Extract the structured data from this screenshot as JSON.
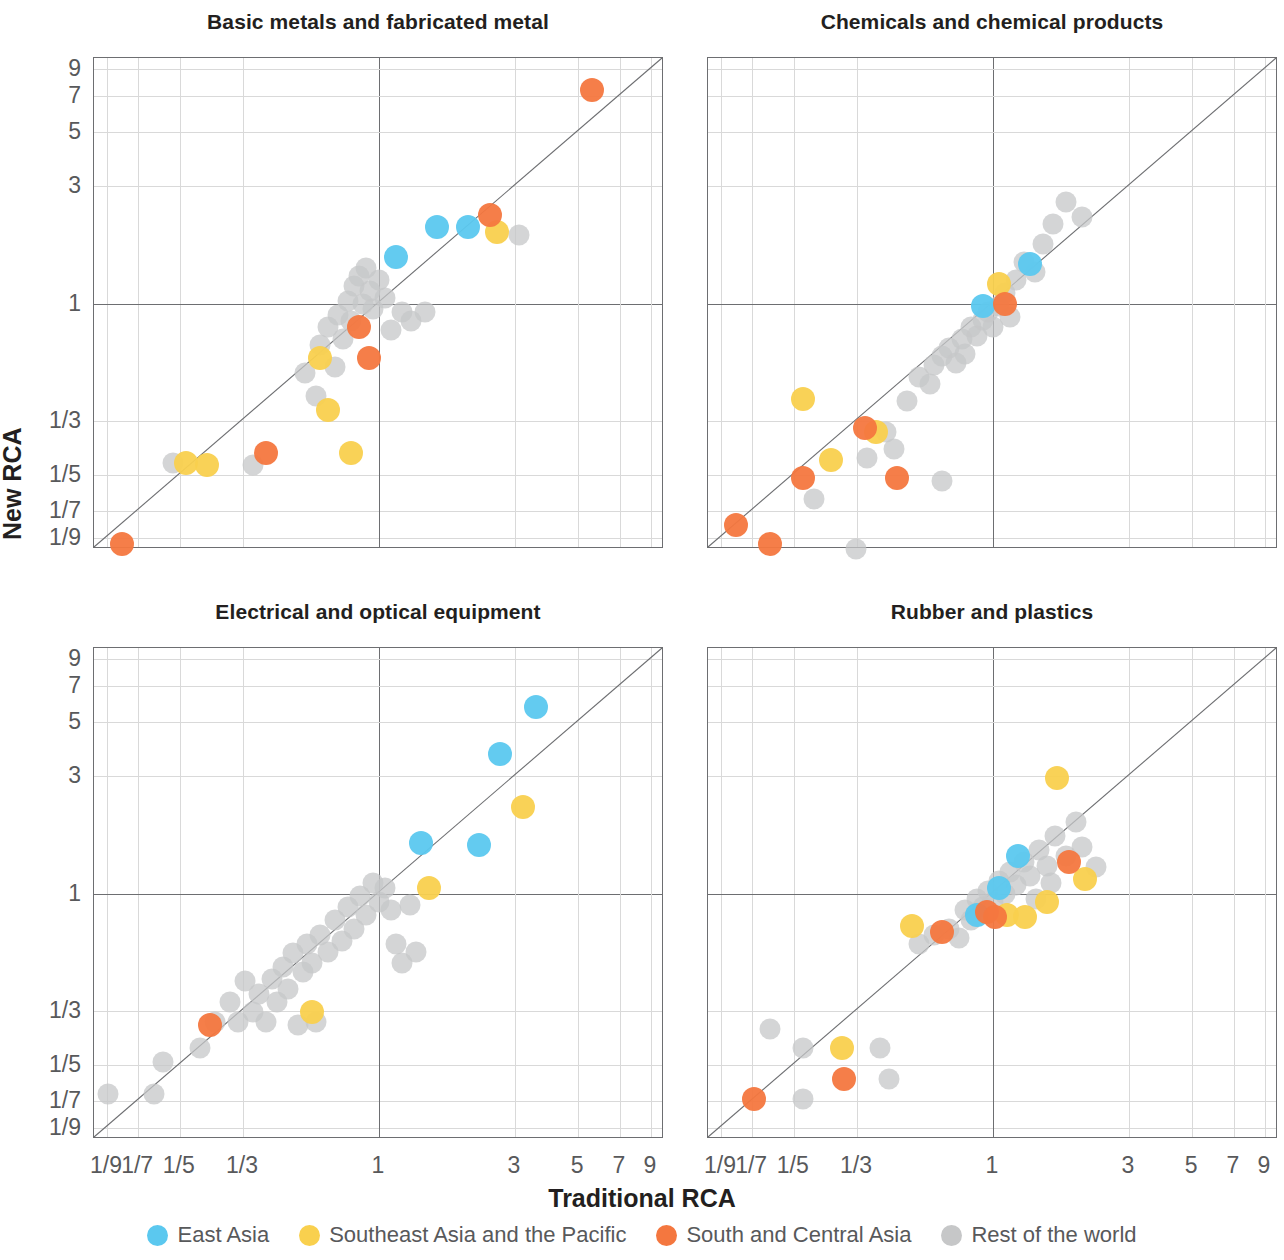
{
  "figure": {
    "xlabel": "Traditional RCA",
    "ylabel": "New RCA"
  },
  "legend": {
    "items": [
      {
        "label": "East Asia",
        "color": "#5BC8EF",
        "key": "east_asia"
      },
      {
        "label": "Southeast Asia and the Pacific",
        "color": "#F9D04E",
        "key": "southeast_asia_pacific"
      },
      {
        "label": "South and Central Asia",
        "color": "#F4773F",
        "key": "south_central_asia"
      },
      {
        "label": "Rest of the world",
        "color": "#C6C7C8",
        "key": "rest_of_world"
      }
    ]
  },
  "axis": {
    "x_ticks": [
      "1/9",
      "1/7",
      "1/5",
      "1/3",
      "1",
      "3",
      "5",
      "7",
      "9"
    ],
    "y_ticks": [
      "9",
      "7",
      "5",
      "3",
      "1",
      "1/3",
      "1/5",
      "1/7",
      "1/9"
    ],
    "tick_values": [
      0.1111,
      0.1429,
      0.2,
      0.3333,
      1,
      3,
      5,
      7,
      9
    ],
    "range_log_min": -2.302585,
    "range_log_max": 2.302585
  },
  "chart_data": [
    {
      "type": "scatter",
      "title": "Basic metals and fabricated metal",
      "xlabel": "Traditional RCA",
      "ylabel": "New RCA",
      "xscale": "log",
      "yscale": "log",
      "xlim": [
        0.0909,
        10.0
      ],
      "ylim": [
        0.0909,
        10.0
      ],
      "grid": true,
      "reference_line": "y = x (45 degree diagonal)",
      "series": [
        {
          "name": "East Asia",
          "color": "#5BC8EF",
          "points": [
            [
              1.15,
              1.55
            ],
            [
              1.6,
              2.05
            ],
            [
              2.05,
              2.05
            ]
          ]
        },
        {
          "name": "Southeast Asia and the Pacific",
          "color": "#F9D04E",
          "points": [
            [
              0.21,
              0.225
            ],
            [
              0.25,
              0.22
            ],
            [
              0.62,
              0.6
            ],
            [
              0.66,
              0.37
            ],
            [
              0.8,
              0.245
            ],
            [
              2.6,
              1.95
            ]
          ]
        },
        {
          "name": "South and Central Asia",
          "color": "#F4773F",
          "points": [
            [
              0.125,
              0.105
            ],
            [
              0.4,
              0.245
            ],
            [
              0.85,
              0.8
            ],
            [
              0.92,
              0.6
            ],
            [
              2.45,
              2.3
            ],
            [
              5.6,
              7.4
            ]
          ]
        },
        {
          "name": "Rest of the world",
          "color": "#C6C7C8",
          "points": [
            [
              0.19,
              0.225
            ],
            [
              0.36,
              0.22
            ],
            [
              0.55,
              0.52
            ],
            [
              0.6,
              0.42
            ],
            [
              0.62,
              0.68
            ],
            [
              0.66,
              0.8
            ],
            [
              0.7,
              0.55
            ],
            [
              0.72,
              0.9
            ],
            [
              0.75,
              0.72
            ],
            [
              0.78,
              1.02
            ],
            [
              0.8,
              0.85
            ],
            [
              0.82,
              1.18
            ],
            [
              0.85,
              1.3
            ],
            [
              0.88,
              1.0
            ],
            [
              0.9,
              1.4
            ],
            [
              0.93,
              1.12
            ],
            [
              0.95,
              0.95
            ],
            [
              1.0,
              1.25
            ],
            [
              1.05,
              1.05
            ],
            [
              1.1,
              0.78
            ],
            [
              1.2,
              0.92
            ],
            [
              1.3,
              0.85
            ],
            [
              1.45,
              0.92
            ],
            [
              3.1,
              1.9
            ]
          ]
        }
      ]
    },
    {
      "type": "scatter",
      "title": "Chemicals and chemical products",
      "xlabel": "Traditional RCA",
      "ylabel": "New RCA",
      "xscale": "log",
      "yscale": "log",
      "xlim": [
        0.0909,
        10.0
      ],
      "ylim": [
        0.0909,
        10.0
      ],
      "grid": true,
      "reference_line": "y = x (45 degree diagonal)",
      "series": [
        {
          "name": "East Asia",
          "color": "#5BC8EF",
          "points": [
            [
              0.92,
              0.98
            ],
            [
              1.35,
              1.45
            ]
          ]
        },
        {
          "name": "Southeast Asia and the Pacific",
          "color": "#F9D04E",
          "points": [
            [
              0.215,
              0.41
            ],
            [
              0.27,
              0.23
            ],
            [
              0.39,
              0.3
            ],
            [
              1.05,
              1.2
            ]
          ]
        },
        {
          "name": "South and Central Asia",
          "color": "#F4773F",
          "points": [
            [
              0.125,
              0.125
            ],
            [
              0.165,
              0.105
            ],
            [
              0.215,
              0.195
            ],
            [
              0.355,
              0.31
            ],
            [
              0.46,
              0.195
            ],
            [
              1.1,
              1.0
            ]
          ]
        },
        {
          "name": "Rest of the world",
          "color": "#C6C7C8",
          "points": [
            [
              0.235,
              0.16
            ],
            [
              0.33,
              0.1
            ],
            [
              0.36,
              0.235
            ],
            [
              0.42,
              0.3
            ],
            [
              0.45,
              0.255
            ],
            [
              0.5,
              0.4
            ],
            [
              0.55,
              0.5
            ],
            [
              0.6,
              0.47
            ],
            [
              0.62,
              0.56
            ],
            [
              0.66,
              0.61
            ],
            [
              0.7,
              0.66
            ],
            [
              0.74,
              0.57
            ],
            [
              0.78,
              0.72
            ],
            [
              0.8,
              0.62
            ],
            [
              0.84,
              0.8
            ],
            [
              0.88,
              0.74
            ],
            [
              0.92,
              0.86
            ],
            [
              0.96,
              0.92
            ],
            [
              1.0,
              0.8
            ],
            [
              1.05,
              0.98
            ],
            [
              1.1,
              1.1
            ],
            [
              1.15,
              0.88
            ],
            [
              1.2,
              1.25
            ],
            [
              1.28,
              1.48
            ],
            [
              1.4,
              1.35
            ],
            [
              1.5,
              1.75
            ],
            [
              1.62,
              2.1
            ],
            [
              1.8,
              2.6
            ],
            [
              2.05,
              2.25
            ],
            [
              0.66,
              0.19
            ]
          ]
        }
      ]
    },
    {
      "type": "scatter",
      "title": "Electrical and optical equipment",
      "xlabel": "Traditional RCA",
      "ylabel": "New RCA",
      "xscale": "log",
      "yscale": "log",
      "xlim": [
        0.0909,
        10.0
      ],
      "ylim": [
        0.0909,
        10.0
      ],
      "grid": true,
      "reference_line": "y = x (45 degree diagonal)",
      "series": [
        {
          "name": "East Asia",
          "color": "#5BC8EF",
          "points": [
            [
              1.4,
              1.6
            ],
            [
              2.25,
              1.58
            ],
            [
              2.65,
              3.7
            ],
            [
              3.55,
              5.75
            ]
          ]
        },
        {
          "name": "Southeast Asia and the Pacific",
          "color": "#F9D04E",
          "points": [
            [
              0.58,
              0.33
            ],
            [
              1.5,
              1.05
            ],
            [
              3.2,
              2.25
            ]
          ]
        },
        {
          "name": "South and Central Asia",
          "color": "#F4773F",
          "points": [
            [
              0.255,
              0.29
            ]
          ]
        },
        {
          "name": "Rest of the world",
          "color": "#C6C7C8",
          "points": [
            [
              0.112,
              0.153
            ],
            [
              0.162,
              0.152
            ],
            [
              0.175,
              0.205
            ],
            [
              0.235,
              0.235
            ],
            [
              0.265,
              0.3
            ],
            [
              0.3,
              0.36
            ],
            [
              0.32,
              0.3
            ],
            [
              0.34,
              0.44
            ],
            [
              0.36,
              0.33
            ],
            [
              0.38,
              0.39
            ],
            [
              0.4,
              0.3
            ],
            [
              0.42,
              0.45
            ],
            [
              0.44,
              0.36
            ],
            [
              0.46,
              0.5
            ],
            [
              0.48,
              0.41
            ],
            [
              0.5,
              0.57
            ],
            [
              0.52,
              0.29
            ],
            [
              0.54,
              0.48
            ],
            [
              0.56,
              0.62
            ],
            [
              0.58,
              0.52
            ],
            [
              0.6,
              0.3
            ],
            [
              0.62,
              0.68
            ],
            [
              0.66,
              0.58
            ],
            [
              0.7,
              0.78
            ],
            [
              0.74,
              0.64
            ],
            [
              0.78,
              0.88
            ],
            [
              0.82,
              0.72
            ],
            [
              0.86,
              0.98
            ],
            [
              0.9,
              0.82
            ],
            [
              0.95,
              1.1
            ],
            [
              1.0,
              0.92
            ],
            [
              1.05,
              1.05
            ],
            [
              1.1,
              0.86
            ],
            [
              1.15,
              0.62
            ],
            [
              1.2,
              0.52
            ],
            [
              1.28,
              0.9
            ],
            [
              1.35,
              0.58
            ]
          ]
        }
      ]
    },
    {
      "type": "scatter",
      "title": "Rubber and plastics",
      "xlabel": "Traditional RCA",
      "ylabel": "New RCA",
      "xscale": "log",
      "yscale": "log",
      "xlim": [
        0.0909,
        10.0
      ],
      "ylim": [
        0.0909,
        10.0
      ],
      "grid": true,
      "reference_line": "y = x (45 degree diagonal)",
      "series": [
        {
          "name": "East Asia",
          "color": "#5BC8EF",
          "points": [
            [
              0.88,
              0.82
            ],
            [
              1.05,
              1.05
            ],
            [
              1.22,
              1.42
            ]
          ]
        },
        {
          "name": "Southeast Asia and the Pacific",
          "color": "#F9D04E",
          "points": [
            [
              0.295,
              0.235
            ],
            [
              0.52,
              0.74
            ],
            [
              1.12,
              0.82
            ],
            [
              1.55,
              0.92
            ],
            [
              1.68,
              2.95
            ],
            [
              2.1,
              1.15
            ],
            [
              1.3,
              0.8
            ]
          ]
        },
        {
          "name": "South and Central Asia",
          "color": "#F4773F",
          "points": [
            [
              0.145,
              0.145
            ],
            [
              0.3,
              0.175
            ],
            [
              0.66,
              0.7
            ],
            [
              0.95,
              0.84
            ],
            [
              1.02,
              0.8
            ],
            [
              1.85,
              1.35
            ]
          ]
        },
        {
          "name": "Rest of the world",
          "color": "#C6C7C8",
          "points": [
            [
              0.165,
              0.28
            ],
            [
              0.215,
              0.235
            ],
            [
              0.215,
              0.145
            ],
            [
              0.4,
              0.235
            ],
            [
              0.43,
              0.175
            ],
            [
              0.55,
              0.62
            ],
            [
              0.62,
              0.68
            ],
            [
              0.7,
              0.72
            ],
            [
              0.76,
              0.66
            ],
            [
              0.8,
              0.86
            ],
            [
              0.84,
              0.78
            ],
            [
              0.88,
              0.95
            ],
            [
              0.92,
              0.88
            ],
            [
              0.96,
              1.02
            ],
            [
              1.0,
              0.92
            ],
            [
              1.05,
              1.12
            ],
            [
              1.1,
              1.0
            ],
            [
              1.15,
              1.22
            ],
            [
              1.2,
              1.08
            ],
            [
              1.28,
              1.35
            ],
            [
              1.35,
              1.18
            ],
            [
              1.45,
              1.5
            ],
            [
              1.55,
              1.3
            ],
            [
              1.65,
              1.72
            ],
            [
              1.8,
              1.42
            ],
            [
              1.95,
              1.95
            ],
            [
              2.05,
              1.55
            ],
            [
              2.3,
              1.28
            ],
            [
              1.6,
              1.1
            ],
            [
              1.42,
              0.95
            ]
          ]
        }
      ]
    }
  ],
  "panels": [
    {
      "title": "Basic metals and fabricated metal"
    },
    {
      "title": "Chemicals and chemical products"
    },
    {
      "title": "Electrical and optical equipment"
    },
    {
      "title": "Rubber and plastics"
    }
  ]
}
